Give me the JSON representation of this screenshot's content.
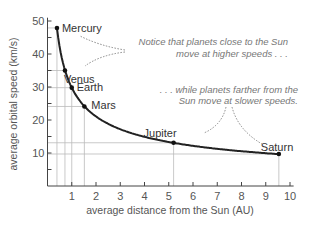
{
  "chart_data": {
    "type": "scatter",
    "title": "",
    "xlabel": "average distance from the Sun (AU)",
    "ylabel": "average orbital speed (km/s)",
    "xlim": [
      0,
      10
    ],
    "ylim": [
      0,
      50
    ],
    "x_ticks": [
      "1",
      "2",
      "3",
      "4",
      "5",
      "6",
      "7",
      "8",
      "9",
      "10"
    ],
    "y_ticks": [
      "10",
      "20",
      "30",
      "40",
      "50"
    ],
    "grid": "drop-lines from each planet to axes",
    "series": [
      {
        "name": "planets",
        "points": [
          {
            "label": "Mercury",
            "x": 0.39,
            "y": 47.9
          },
          {
            "label": "Venus",
            "x": 0.72,
            "y": 35.0
          },
          {
            "label": "Earth",
            "x": 1.0,
            "y": 29.8
          },
          {
            "label": "Mars",
            "x": 1.52,
            "y": 24.1
          },
          {
            "label": "Jupiter",
            "x": 5.2,
            "y": 13.1
          },
          {
            "label": "Saturn",
            "x": 9.54,
            "y": 9.7
          }
        ],
        "curve": "smooth fit through points"
      }
    ],
    "annotations": [
      {
        "text_line1": "Notice that planets close to the Sun",
        "text_line2": "move at higher speeds . . .",
        "arrows_to": [
          "Mercury",
          "Venus"
        ]
      },
      {
        "text_line1": ". . . while planets farther from the",
        "text_line2": "Sun move at slower speeds.",
        "arrows_to": [
          "Jupiter",
          "Saturn"
        ]
      }
    ]
  }
}
